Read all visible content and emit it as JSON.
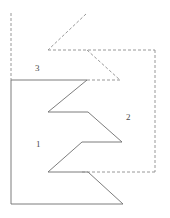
{
  "figure": {
    "canvas": {
      "width": 170,
      "height": 218,
      "background": "#ffffff"
    },
    "stroke": {
      "solid_color": "#6e6e6e",
      "dashed_color": "#8d8d8d",
      "width": 0.9,
      "dash_pattern": "3,2"
    },
    "labels": [
      {
        "id": "label-1",
        "text": "1",
        "x": 36,
        "y": 140
      },
      {
        "id": "label-2",
        "text": "2",
        "x": 126,
        "y": 113
      },
      {
        "id": "label-3",
        "text": "3",
        "x": 35,
        "y": 64
      }
    ],
    "paths": {
      "solid_zigzag_region": {
        "name": "region-1-outline",
        "style": "solid",
        "points": "11,80 87,80 48,112 88,112 122,142 82,142 48,172 88,172 123,204 11,204 11,80"
      },
      "dashed_left_vertical": {
        "name": "region-3-left-edge",
        "style": "dashed",
        "points": "11,13 11,80"
      },
      "dashed_upper_chevron": {
        "name": "region-3-upper-zigzag",
        "style": "dashed",
        "points": "86,14 48,50"
      },
      "dashed_upper_horizontal": {
        "name": "region-3-top-edge",
        "style": "dashed",
        "points": "48,50 155,50"
      },
      "dashed_chevron_descend": {
        "name": "region-3-lower-zigzag",
        "style": "dashed",
        "points": "87,50 120,80"
      },
      "dashed_inner_horizontal": {
        "name": "region-2-inner-top-edge",
        "style": "dashed",
        "points": "87,80 120,80"
      },
      "dashed_right_vertical": {
        "name": "region-2-right-edge",
        "style": "dashed",
        "points": "155,50 155,172"
      },
      "dashed_bottom_horizontal": {
        "name": "region-2-bottom-edge",
        "style": "dashed",
        "points": "155,172 80,172"
      }
    }
  }
}
